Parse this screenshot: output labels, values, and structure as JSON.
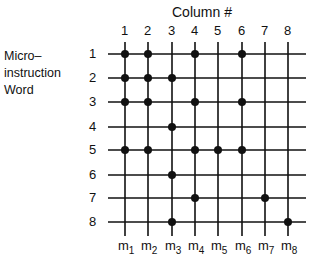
{
  "title": "Column #",
  "row_axis_label": [
    "Micro–",
    "instruction",
    "Word"
  ],
  "columns": [
    "1",
    "2",
    "3",
    "4",
    "5",
    "6",
    "7",
    "8"
  ],
  "rows": [
    "1",
    "2",
    "3",
    "4",
    "5",
    "6",
    "7",
    "8"
  ],
  "outputs": [
    "m1",
    "m2",
    "m3",
    "m4",
    "m5",
    "m6",
    "m7",
    "m8"
  ],
  "output_labels": [
    {
      "base": "m",
      "sub": "1"
    },
    {
      "base": "m",
      "sub": "2"
    },
    {
      "base": "m",
      "sub": "3"
    },
    {
      "base": "m",
      "sub": "4"
    },
    {
      "base": "m",
      "sub": "5"
    },
    {
      "base": "m",
      "sub": "6"
    },
    {
      "base": "m",
      "sub": "7"
    },
    {
      "base": "m",
      "sub": "8"
    }
  ],
  "matrix": [
    [
      1,
      1,
      0,
      1,
      0,
      1,
      0,
      0
    ],
    [
      1,
      1,
      1,
      0,
      0,
      0,
      0,
      0
    ],
    [
      1,
      1,
      0,
      1,
      0,
      1,
      0,
      0
    ],
    [
      0,
      0,
      1,
      0,
      0,
      0,
      0,
      0
    ],
    [
      1,
      1,
      0,
      1,
      1,
      1,
      0,
      0
    ],
    [
      0,
      0,
      1,
      0,
      0,
      0,
      0,
      0
    ],
    [
      0,
      0,
      0,
      1,
      0,
      0,
      1,
      0
    ],
    [
      0,
      0,
      1,
      0,
      0,
      0,
      0,
      1
    ]
  ],
  "colors": {
    "ink": "#111111",
    "background": "#ffffff"
  }
}
